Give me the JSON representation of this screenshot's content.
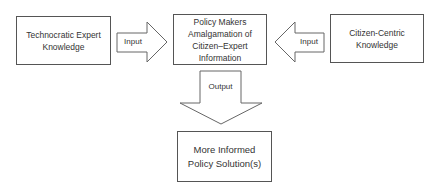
{
  "diagram": {
    "nodes": {
      "expert": {
        "label": "Technocratic Expert\nKnowledge"
      },
      "policy": {
        "label": "Policy Makers\nAmalgamation of\nCitizen–Expert\nInformation"
      },
      "citizen": {
        "label": "Citizen-Centric\nKnowledge"
      },
      "solution": {
        "label": "More Informed\nPolicy Solution(s)"
      }
    },
    "edges": [
      {
        "from": "expert",
        "to": "policy",
        "label": "Input"
      },
      {
        "from": "citizen",
        "to": "policy",
        "label": "Input"
      },
      {
        "from": "policy",
        "to": "solution",
        "label": "Output"
      }
    ],
    "colors": {
      "stroke": "#555555",
      "text": "#333333",
      "fill": "#ffffff"
    }
  }
}
